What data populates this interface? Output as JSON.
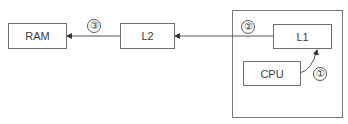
{
  "diagram": {
    "nodes": {
      "ram": {
        "label": "RAM"
      },
      "l2": {
        "label": "L2"
      },
      "l1": {
        "label": "L1"
      },
      "cpu": {
        "label": "CPU"
      }
    },
    "steps": [
      {
        "number": "①",
        "description": "CPU to L1"
      },
      {
        "number": "②",
        "description": "L1 to L2"
      },
      {
        "number": "③",
        "description": "L2 to RAM"
      }
    ],
    "edges": [
      {
        "from": "cpu",
        "to": "l1",
        "step": 1,
        "style": "curved-arrow"
      },
      {
        "from": "l1",
        "to": "l2",
        "step": 2,
        "style": "straight-arrow"
      },
      {
        "from": "l2",
        "to": "ram",
        "step": 3,
        "style": "straight-arrow"
      }
    ],
    "colors": {
      "stroke": "#6e6e6e",
      "text": "#3a3a3a",
      "background": "#ffffff"
    }
  }
}
